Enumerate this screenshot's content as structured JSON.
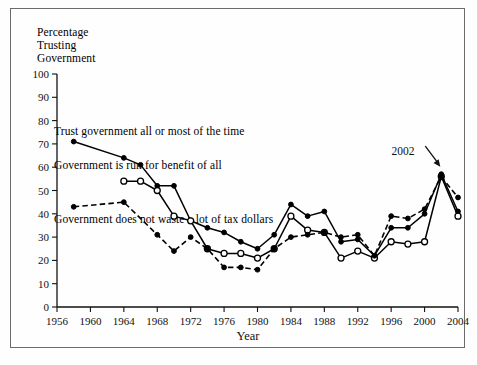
{
  "figure": {
    "y_axis_caption": "Percentage\nTrusting\nGovernment",
    "annotation_label": "2002"
  },
  "chart_data": {
    "type": "line",
    "title": "",
    "xlabel": "Year",
    "ylabel": "Percentage Trusting Government",
    "xlim": [
      1956,
      2004
    ],
    "ylim": [
      0,
      100
    ],
    "ytick_values": [
      0,
      10,
      20,
      30,
      40,
      50,
      60,
      70,
      80,
      90,
      100
    ],
    "ytick_labels": [
      "0",
      "10",
      "20",
      "30",
      "40",
      "50",
      "60",
      "70",
      "80",
      "90",
      "100"
    ],
    "xtick_values": [
      1956,
      1960,
      1964,
      1968,
      1972,
      1976,
      1980,
      1984,
      1988,
      1992,
      1996,
      2000,
      2004
    ],
    "xtick_labels": [
      "1956",
      "1960",
      "1964",
      "1968",
      "1972",
      "1976",
      "1980",
      "1984",
      "1988",
      "1992",
      "1996",
      "2000",
      "2004"
    ],
    "grid": false,
    "legend_position": "inline-annotations",
    "annotations": [
      {
        "text": "2002",
        "x": 2002,
        "y": 57,
        "note": "arrow pointing to convergent peak"
      }
    ],
    "series": [
      {
        "name": "Trust government all or most of the time",
        "style": "solid",
        "marker": "filled-circle",
        "x": [
          1958,
          1964,
          1966,
          1968,
          1970,
          1972,
          1974,
          1976,
          1978,
          1980,
          1982,
          1984,
          1986,
          1988,
          1990,
          1992,
          1994,
          1996,
          1998,
          2000,
          2002,
          2004
        ],
        "y": [
          71,
          64,
          61,
          52,
          52,
          37,
          34,
          32,
          28,
          25,
          31,
          44,
          39,
          41,
          28,
          29,
          22,
          34,
          34,
          40,
          57,
          41
        ]
      },
      {
        "name": "Government is run for benefit of all",
        "style": "solid",
        "marker": "open-circle",
        "x": [
          1964,
          1966,
          1968,
          1970,
          1972,
          1974,
          1976,
          1978,
          1980,
          1982,
          1984,
          1986,
          1988,
          1990,
          1992,
          1994,
          1996,
          1998,
          2000,
          2002,
          2004
        ],
        "y": [
          54,
          54,
          50,
          39,
          37,
          25,
          23,
          23,
          21,
          25,
          39,
          33,
          32,
          21,
          24,
          21,
          28,
          27,
          28,
          56,
          39
        ]
      },
      {
        "name": "Government does not waste a lot of tax dollars",
        "style": "dashed",
        "marker": "filled-circle",
        "x": [
          1958,
          1964,
          1968,
          1970,
          1972,
          1974,
          1976,
          1978,
          1980,
          1982,
          1984,
          1986,
          1988,
          1990,
          1992,
          1994,
          1996,
          1998,
          2000,
          2002,
          2004
        ],
        "y": [
          43,
          45,
          31,
          24,
          30,
          25,
          17,
          17,
          16,
          25,
          30,
          31,
          32,
          30,
          31,
          22,
          39,
          38,
          42,
          56,
          47
        ]
      }
    ]
  }
}
